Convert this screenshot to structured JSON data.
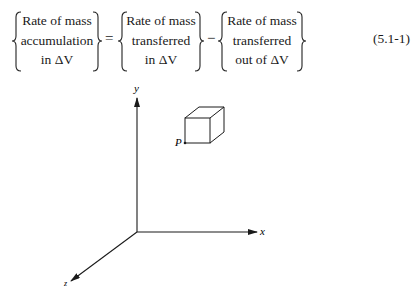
{
  "equation": {
    "left_term": [
      "Rate of mass",
      "accumulation",
      "in ΔV"
    ],
    "equals": "=",
    "middle_term": [
      "Rate of mass",
      "transferred",
      "in ΔV"
    ],
    "minus": "−",
    "right_term": [
      "Rate of mass",
      "transferred",
      "out of ΔV"
    ],
    "number": "(5.1-1)"
  },
  "figure": {
    "axis_labels": {
      "y": "y",
      "x": "x",
      "z": "z"
    },
    "point_label": "P"
  }
}
